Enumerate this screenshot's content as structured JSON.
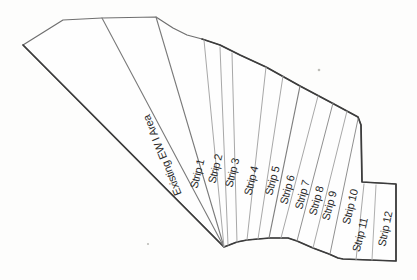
{
  "diagram": {
    "paper": "#fefefe",
    "stroke_outer": "#6f6f6f",
    "stroke_emphasis": "#3c3c3c",
    "stroke_inner_light": "#a8a8a8",
    "stroke_inner_mid": "#8a8a8a",
    "label_color": "#2b2b2b",
    "outline": [
      [
        23,
        45
      ],
      [
        63,
        20
      ],
      [
        102,
        18
      ],
      [
        156,
        17
      ],
      [
        173,
        28
      ],
      [
        187,
        35
      ],
      [
        202,
        39
      ],
      [
        220,
        45
      ],
      [
        240,
        55
      ],
      [
        266,
        67
      ],
      [
        300,
        86
      ],
      [
        332,
        103
      ],
      [
        358,
        117
      ],
      [
        361,
        125
      ],
      [
        362,
        182
      ],
      [
        396,
        184
      ],
      [
        396,
        261
      ],
      [
        343,
        259
      ],
      [
        338,
        258
      ],
      [
        329,
        254
      ],
      [
        313,
        248
      ],
      [
        297,
        241
      ],
      [
        288,
        238
      ],
      [
        270,
        238
      ],
      [
        258,
        239
      ],
      [
        247,
        240
      ],
      [
        237,
        242
      ],
      [
        224,
        247
      ]
    ],
    "outline_emphasis": [
      [
        202,
        39
      ],
      [
        220,
        45
      ],
      [
        240,
        55
      ],
      [
        266,
        67
      ],
      [
        300,
        86
      ],
      [
        332,
        103
      ],
      [
        358,
        117
      ],
      [
        361,
        125
      ],
      [
        362,
        182
      ],
      [
        396,
        184
      ],
      [
        396,
        261
      ],
      [
        343,
        259
      ],
      [
        338,
        258
      ],
      [
        329,
        254
      ],
      [
        313,
        248
      ],
      [
        297,
        241
      ],
      [
        288,
        238
      ],
      [
        270,
        238
      ],
      [
        258,
        239
      ],
      [
        247,
        240
      ],
      [
        237,
        242
      ],
      [
        224,
        247
      ],
      [
        23,
        45
      ]
    ],
    "dividers": [
      {
        "name": "existing-left",
        "x1": 102,
        "y1": 18,
        "x2": 224,
        "y2": 247,
        "color": "#7a7a7a",
        "width": 1.1
      },
      {
        "name": "existing-strip1",
        "x1": 156,
        "y1": 17,
        "x2": 224,
        "y2": 247,
        "color": "#7a7a7a",
        "width": 1.1
      },
      {
        "name": "strip1-strip2",
        "x1": 204,
        "y1": 40,
        "x2": 224,
        "y2": 247,
        "color": "#a8a8a8",
        "width": 1
      },
      {
        "name": "strip2-strip3",
        "x1": 220,
        "y1": 47,
        "x2": 228,
        "y2": 245,
        "color": "#a8a8a8",
        "width": 1
      },
      {
        "name": "strip3-strip4",
        "x1": 232,
        "y1": 53,
        "x2": 237,
        "y2": 242,
        "color": "#a8a8a8",
        "width": 1
      },
      {
        "name": "strip4-strip5",
        "x1": 266,
        "y1": 67,
        "x2": 247,
        "y2": 240,
        "color": "#a8a8a8",
        "width": 1
      },
      {
        "name": "strip5-strip6",
        "x1": 283,
        "y1": 76,
        "x2": 258,
        "y2": 239,
        "color": "#a8a8a8",
        "width": 1
      },
      {
        "name": "strip6-strip7",
        "x1": 300,
        "y1": 86,
        "x2": 269,
        "y2": 238,
        "color": "#808080",
        "width": 1.2
      },
      {
        "name": "strip7-strip8",
        "x1": 318,
        "y1": 96,
        "x2": 281,
        "y2": 238,
        "color": "#a8a8a8",
        "width": 1
      },
      {
        "name": "strip8-strip9",
        "x1": 333,
        "y1": 103,
        "x2": 297,
        "y2": 241,
        "color": "#909090",
        "width": 1
      },
      {
        "name": "strip9-strip10",
        "x1": 347,
        "y1": 111,
        "x2": 313,
        "y2": 248,
        "color": "#a8a8a8",
        "width": 1
      },
      {
        "name": "strip10-strip11",
        "x1": 358,
        "y1": 119,
        "x2": 330,
        "y2": 254,
        "color": "#909090",
        "width": 1
      },
      {
        "name": "strip11-lower-left",
        "x1": 364,
        "y1": 184,
        "x2": 356,
        "y2": 260,
        "color": "#a8a8a8",
        "width": 1
      },
      {
        "name": "strip11-strip12",
        "x1": 376,
        "y1": 185,
        "x2": 372,
        "y2": 260,
        "color": "#b0b0b0",
        "width": 1
      }
    ],
    "labels": [
      {
        "id": "existing-area",
        "text": "Existing EW I Area",
        "x": 163,
        "y": 155,
        "rotate": -112,
        "size": 11
      },
      {
        "id": "strip-1",
        "text": "Strip 1",
        "x": 198,
        "y": 174,
        "rotate": -76,
        "size": 11
      },
      {
        "id": "strip-2",
        "text": "Strip 2",
        "x": 216,
        "y": 169,
        "rotate": -76,
        "size": 11
      },
      {
        "id": "strip-3",
        "text": "Strip 3",
        "x": 233,
        "y": 173,
        "rotate": -76,
        "size": 11
      },
      {
        "id": "strip-4",
        "text": "Strip 4",
        "x": 252,
        "y": 181,
        "rotate": -76,
        "size": 11
      },
      {
        "id": "strip-5",
        "text": "Strip 5",
        "x": 273,
        "y": 181,
        "rotate": -75,
        "size": 11
      },
      {
        "id": "strip-6",
        "text": "Strip 6",
        "x": 288,
        "y": 190,
        "rotate": -75,
        "size": 11
      },
      {
        "id": "strip-7",
        "text": "Strip 7",
        "x": 303,
        "y": 195,
        "rotate": -75,
        "size": 11
      },
      {
        "id": "strip-8",
        "text": "Strip 8",
        "x": 317,
        "y": 201,
        "rotate": -75,
        "size": 11
      },
      {
        "id": "strip-9",
        "text": "Strip 9",
        "x": 330,
        "y": 206,
        "rotate": -75,
        "size": 11
      },
      {
        "id": "strip-10",
        "text": "Strip 10",
        "x": 351,
        "y": 207,
        "rotate": -76,
        "size": 11
      },
      {
        "id": "strip-11",
        "text": "Strip 11",
        "x": 361,
        "y": 235,
        "rotate": -76,
        "size": 11
      },
      {
        "id": "strip-12",
        "text": "Strip 12",
        "x": 386,
        "y": 229,
        "rotate": -78,
        "size": 11
      }
    ],
    "specks": [
      [
        319,
        70,
        1.3
      ],
      [
        148,
        244,
        1.1
      ]
    ]
  }
}
